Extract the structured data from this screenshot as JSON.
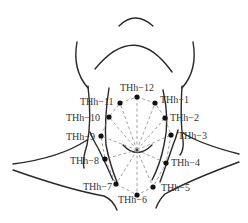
{
  "figure": {
    "colors": {
      "outline": "#2a2a2a",
      "dashed_lines": "#8a8a8a",
      "points": "#111111",
      "labels": "#333333"
    },
    "points": [
      {
        "id": "THh-12",
        "label": "THh−12"
      },
      {
        "id": "THh-1",
        "label": "THh−1"
      },
      {
        "id": "THh-2",
        "label": "THh−2"
      },
      {
        "id": "THh-3",
        "label": "THh−3"
      },
      {
        "id": "THh-4",
        "label": "THh−4"
      },
      {
        "id": "THh-5",
        "label": "THh−5"
      },
      {
        "id": "THh-6",
        "label": "THh−6"
      },
      {
        "id": "THh-7",
        "label": "THh−7"
      },
      {
        "id": "THh-8",
        "label": "THh−8"
      },
      {
        "id": "THh-9",
        "label": "THh−9"
      },
      {
        "id": "THh-10",
        "label": "THh−10"
      },
      {
        "id": "THh-11",
        "label": "THh−11"
      }
    ]
  }
}
